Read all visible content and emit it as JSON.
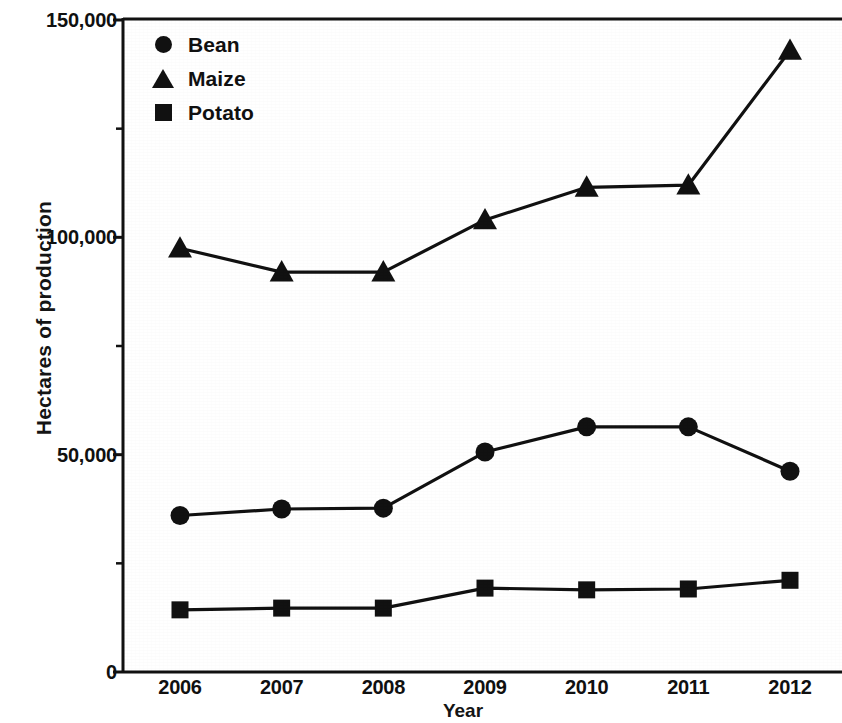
{
  "chart_data": {
    "type": "line",
    "title": "",
    "subtitle": "",
    "xlabel": "Year",
    "ylabel": "Hectares of production",
    "categories": [
      "2006",
      "2007",
      "2008",
      "2009",
      "2010",
      "2011",
      "2012"
    ],
    "x": [
      2006,
      2007,
      2008,
      2009,
      2010,
      2011,
      2012
    ],
    "series": [
      {
        "name": "Bean",
        "marker": "circle",
        "color": "#111111",
        "values": [
          36000,
          37500,
          37700,
          50600,
          56400,
          56400,
          46200
        ]
      },
      {
        "name": "Maize",
        "marker": "triangle",
        "color": "#111111",
        "values": [
          97500,
          92000,
          92000,
          104000,
          111500,
          112000,
          143000
        ]
      },
      {
        "name": "Potato",
        "marker": "square",
        "color": "#111111",
        "values": [
          14300,
          14700,
          14700,
          19300,
          18900,
          19100,
          21100
        ]
      }
    ],
    "ylim": [
      0,
      150000
    ],
    "y_major_ticks": [
      0,
      50000,
      100000,
      150000
    ],
    "y_major_tick_labels": [
      "0",
      "50,000",
      "100,000",
      "150,000"
    ],
    "y_minor_ticks": [
      25000,
      75000,
      125000
    ],
    "grid": false,
    "legend_position": "top-left",
    "legend_entries": [
      "Bean",
      "Maize",
      "Potato"
    ],
    "axis_color": "#111111",
    "background_color": "#ffffff"
  },
  "legend": {
    "items": [
      {
        "label": "Bean",
        "marker": "circle-marker"
      },
      {
        "label": "Maize",
        "marker": "triangle-marker"
      },
      {
        "label": "Potato",
        "marker": "square-marker"
      }
    ]
  },
  "axes": {
    "y_title": "Hectares of production",
    "x_title": "Year",
    "y_labels": [
      "150,000",
      "100,000",
      "50,000",
      "0"
    ],
    "x_labels": [
      "2006",
      "2007",
      "2008",
      "2009",
      "2010",
      "2011",
      "2012"
    ]
  }
}
